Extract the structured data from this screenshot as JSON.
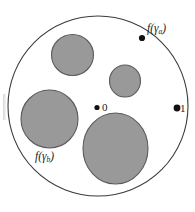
{
  "figure": {
    "caption_type": "complex-analysis-disk-diagram",
    "colors": {
      "background": "#ffffff",
      "disk_fill": "#ffffff",
      "disk_stroke": "#3b3b3b",
      "inner_disk_fill": "#999999",
      "inner_disk_stroke": "#5a5a5a",
      "point_color": "#111111",
      "text_color": "#1a1a1a"
    },
    "outer_circle": {
      "name": "unit-circle",
      "cx": 98,
      "cy": 106,
      "r": 90,
      "stroke_width": 1.1
    },
    "inner_disks": [
      {
        "name": "inner-disk-top",
        "cx": 72.5,
        "cy": 55.0,
        "rx": 21.0,
        "ry": 20.5
      },
      {
        "name": "inner-disk-small",
        "cx": 125.0,
        "cy": 81.0,
        "rx": 15.5,
        "ry": 16.0
      },
      {
        "name": "inner-disk-left",
        "cx": 49.5,
        "cy": 119.0,
        "rx": 28.5,
        "ry": 29.0
      },
      {
        "name": "inner-disk-bottom",
        "cx": 115.5,
        "cy": 148.5,
        "rx": 32.5,
        "ry": 35.5
      }
    ],
    "points": [
      {
        "name": "point-f-gamma-a",
        "cx": 142.0,
        "cy": 38.0,
        "r": 3.1,
        "label_id": "label-f-gamma-a"
      },
      {
        "name": "point-one",
        "cx": 177.0,
        "cy": 108.0,
        "r": 3.4,
        "label_id": "label-one"
      },
      {
        "name": "point-zero",
        "cx": 97.0,
        "cy": 107.5,
        "r": 2.6,
        "label_id": "label-zero"
      }
    ],
    "labels": {
      "f_gamma_a": {
        "func": "f(γ",
        "sub": "a",
        "close": ")"
      },
      "f_gamma_b": {
        "func": "f(γ",
        "sub": "b",
        "close": ")"
      },
      "zero": "0",
      "one": "1"
    }
  }
}
